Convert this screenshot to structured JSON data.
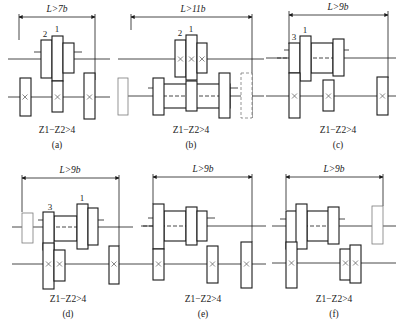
{
  "figure": {
    "panels": [
      {
        "id": "a",
        "label": "(a)",
        "dimension": "L>7b",
        "condition": "Z1−Z2>4",
        "gear_numbers": [
          "2",
          "1"
        ]
      },
      {
        "id": "b",
        "label": "(b)",
        "dimension": "L>11b",
        "condition": "Z1−Z2>4",
        "gear_numbers": [
          "2",
          "1"
        ]
      },
      {
        "id": "c",
        "label": "(c)",
        "dimension": "L>9b",
        "condition": "Z1−Z2>4",
        "gear_numbers": [
          "3",
          "1"
        ]
      },
      {
        "id": "d",
        "label": "(d)",
        "dimension": "L>9b",
        "condition": "Z1−Z2>4",
        "gear_numbers": [
          "3",
          "1"
        ]
      },
      {
        "id": "e",
        "label": "(e)",
        "dimension": "L>9b",
        "condition": "Z1−Z2>4",
        "gear_numbers": []
      },
      {
        "id": "f",
        "label": "(f)",
        "dimension": "L>9b",
        "condition": "Z1−Z2>4",
        "gear_numbers": []
      }
    ]
  }
}
